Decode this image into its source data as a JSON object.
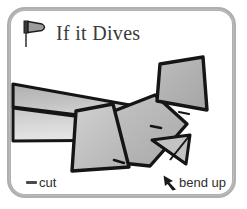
{
  "card": {
    "title": "If it Dives",
    "title_icon": "pennant-flag-icon",
    "frame_color": "#a9a9a9",
    "background_color": "#ffffff"
  },
  "illustration": {
    "name": "paper-airplane-tail-diagram",
    "description": "Rear three-quarter view of a folded paper airplane showing the fuselage, swept wing, raised tail fin and a small triangular elevator flap",
    "ink_color": "#151515",
    "fill_light": "#d2d2d2",
    "fill_mid": "#b5b5b5",
    "fill_dark": "#9a9a9a",
    "parts": [
      "wing-upper-surface",
      "wing-lower-edge",
      "fuselage-body",
      "vertical-fin",
      "tail-panel",
      "elevator-flap"
    ]
  },
  "callouts": [
    {
      "id": "cut",
      "label": "cut",
      "marker": "cut-dash-marker",
      "marker_color": "#4a4a4a"
    },
    {
      "id": "bend-up",
      "label": "bend up",
      "marker": "bend-up-arrow-icon",
      "marker_color": "#1a1a1a"
    }
  ]
}
